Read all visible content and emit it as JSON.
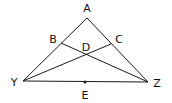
{
  "diagram": {
    "type": "geometry-triangle",
    "points": {
      "A": {
        "label": "A",
        "x": 87,
        "y": 18,
        "lx": 87,
        "ly": 12
      },
      "B": {
        "label": "B",
        "x": 61,
        "y": 43,
        "lx": 53,
        "ly": 43
      },
      "C": {
        "label": "C",
        "x": 111,
        "y": 44,
        "lx": 119,
        "ly": 43
      },
      "D": {
        "label": "D",
        "x": 86,
        "y": 55,
        "lx": 86,
        "ly": 51
      },
      "Y": {
        "label": "Y",
        "x": 23,
        "y": 81,
        "lx": 14,
        "ly": 86
      },
      "Z": {
        "label": "Z",
        "x": 148,
        "y": 82,
        "lx": 157,
        "ly": 87
      },
      "E": {
        "label": "E",
        "x": 85,
        "y": 82,
        "lx": 85,
        "ly": 99
      }
    },
    "segments": [
      [
        "A",
        "Y"
      ],
      [
        "A",
        "Z"
      ],
      [
        "Y",
        "Z"
      ],
      [
        "B",
        "Z"
      ],
      [
        "Y",
        "C"
      ]
    ],
    "marked_points": [
      "E"
    ],
    "colors": {
      "line": "#1a1a1a",
      "text": "#111111",
      "background": "#ffffff"
    }
  }
}
